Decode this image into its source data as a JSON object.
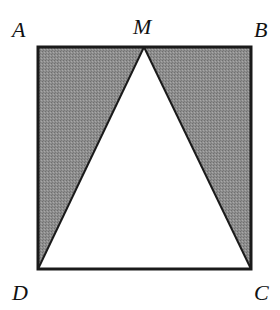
{
  "diagram": {
    "colors": {
      "shade": "#8a8a8a",
      "stroke": "#1a1a1a",
      "background": "#ffffff"
    },
    "points": {
      "A": {
        "label": "A",
        "x": 38,
        "y": 47
      },
      "B": {
        "label": "B",
        "x": 251,
        "y": 47
      },
      "C": {
        "label": "C",
        "x": 251,
        "y": 269
      },
      "D": {
        "label": "D",
        "x": 38,
        "y": 269
      },
      "M": {
        "label": "M",
        "x": 144,
        "y": 47
      }
    },
    "labels": {
      "A": "A",
      "B": "B",
      "C": "C",
      "D": "D",
      "M": "M"
    },
    "shaded_regions": [
      "triangle AMD",
      "triangle MBC"
    ],
    "unshaded_region": "triangle MDC"
  }
}
